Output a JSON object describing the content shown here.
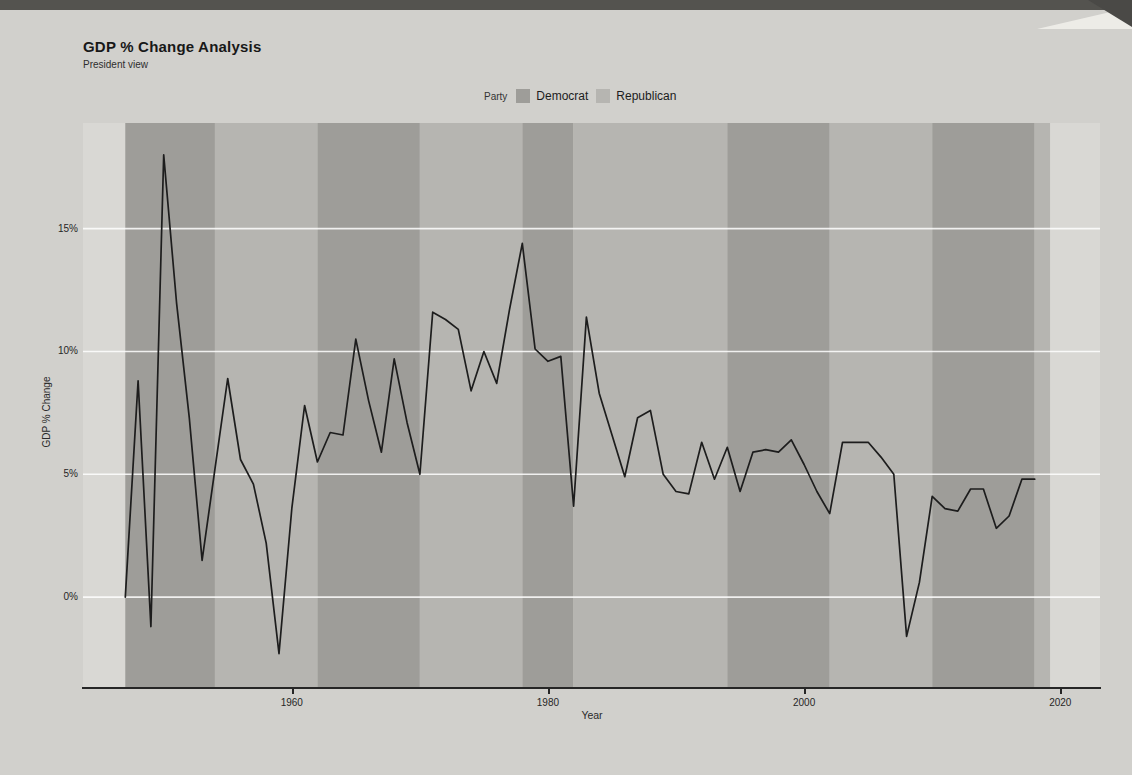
{
  "page": {
    "title": "GDP % Change Analysis",
    "subtitle": "President view"
  },
  "legend": {
    "label": "Party",
    "items": [
      {
        "label": "Democrat",
        "color": "#9e9d99"
      },
      {
        "label": "Republican",
        "color": "#b6b5b1"
      }
    ]
  },
  "axes": {
    "xlabel": "Year",
    "ylabel": "GDP % Change"
  },
  "colors": {
    "page_bg": "#d1d0cc",
    "panel_bg": "#d9d8d4",
    "democrat_band": "#9e9d99",
    "republican_band": "#b6b5b1",
    "gridline": "#ffffff",
    "line": "#1d1d1d",
    "axis": "#262626"
  },
  "chart_data": {
    "type": "line",
    "title": "GDP % Change Analysis",
    "subtitle": "President view",
    "xlabel": "Year",
    "ylabel": "GDP % Change",
    "grid": "horizontal white gridlines at y ticks",
    "legend_position": "top-center",
    "xlim": [
      1943.7,
      2023.1
    ],
    "ylim": [
      -3.7,
      19.3
    ],
    "x_ticks": [
      {
        "value": 1960,
        "label": "1960"
      },
      {
        "value": 1980,
        "label": "1980"
      },
      {
        "value": 2000,
        "label": "2000"
      },
      {
        "value": 2020,
        "label": "2020"
      }
    ],
    "y_ticks": [
      {
        "value": 0,
        "label": "0%"
      },
      {
        "value": 5,
        "label": "5%"
      },
      {
        "value": 10,
        "label": "10%"
      },
      {
        "value": 15,
        "label": "15%"
      }
    ],
    "background_bands": [
      {
        "party": "Democrat",
        "start": 1947,
        "end": 1954
      },
      {
        "party": "Republican",
        "start": 1954,
        "end": 1962
      },
      {
        "party": "Democrat",
        "start": 1962,
        "end": 1970
      },
      {
        "party": "Republican",
        "start": 1970,
        "end": 1978
      },
      {
        "party": "Democrat",
        "start": 1978,
        "end": 1982
      },
      {
        "party": "Republican",
        "start": 1982,
        "end": 1994
      },
      {
        "party": "Democrat",
        "start": 1994,
        "end": 2002
      },
      {
        "party": "Republican",
        "start": 2002,
        "end": 2010
      },
      {
        "party": "Democrat",
        "start": 2010,
        "end": 2018
      },
      {
        "party": "Republican",
        "start": 2018,
        "end": 2019.2
      }
    ],
    "series": [
      {
        "name": "GDP % Change",
        "x": [
          1947,
          1948,
          1949,
          1950,
          1951,
          1952,
          1953,
          1954,
          1955,
          1956,
          1957,
          1958,
          1959,
          1960,
          1961,
          1962,
          1963,
          1964,
          1965,
          1966,
          1967,
          1968,
          1969,
          1970,
          1971,
          1972,
          1973,
          1974,
          1975,
          1976,
          1977,
          1978,
          1979,
          1980,
          1981,
          1982,
          1983,
          1984,
          1985,
          1986,
          1987,
          1988,
          1989,
          1990,
          1991,
          1992,
          1993,
          1994,
          1995,
          1996,
          1997,
          1998,
          1999,
          2000,
          2001,
          2002,
          2003,
          2004,
          2005,
          2006,
          2007,
          2008,
          2009,
          2010,
          2011,
          2012,
          2013,
          2014,
          2015,
          2016,
          2017,
          2018
        ],
        "y": [
          0.0,
          8.8,
          -1.2,
          18.0,
          12.0,
          7.3,
          1.5,
          5.2,
          8.9,
          5.6,
          4.6,
          2.2,
          -2.3,
          3.6,
          7.8,
          5.5,
          6.7,
          6.6,
          10.5,
          8.0,
          5.9,
          9.7,
          7.1,
          5.0,
          11.6,
          11.3,
          10.9,
          8.4,
          10.0,
          8.7,
          11.7,
          14.4,
          10.1,
          9.6,
          9.8,
          3.7,
          11.4,
          8.3,
          6.6,
          4.9,
          7.3,
          7.6,
          5.0,
          4.3,
          4.2,
          6.3,
          4.8,
          6.1,
          4.3,
          5.9,
          6.0,
          5.9,
          6.4,
          5.4,
          4.3,
          3.4,
          6.3,
          6.3,
          6.3,
          5.7,
          5.0,
          -1.6,
          0.6,
          4.1,
          3.6,
          3.5,
          4.4,
          4.4,
          2.8,
          3.3,
          4.8,
          4.8
        ]
      }
    ]
  }
}
